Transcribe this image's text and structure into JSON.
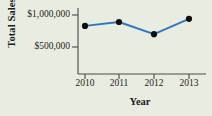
{
  "chart_data": {
    "type": "line",
    "title": "",
    "xlabel": "Year",
    "ylabel": "Total Sales",
    "categories": [
      "2010",
      "2011",
      "2012",
      "2013"
    ],
    "x": [
      2010,
      2011,
      2012,
      2013
    ],
    "values": [
      830000,
      890000,
      700000,
      940000
    ],
    "series": [
      {
        "name": "Total Sales",
        "values": [
          830000,
          890000,
          700000,
          940000
        ]
      }
    ],
    "ytick_labels": [
      "$1,000,000",
      "$500,000"
    ],
    "ytick_values": [
      1000000,
      500000
    ],
    "xtick_labels": [
      "2010",
      "2011",
      "2012",
      "2013"
    ],
    "ylim": [
      0,
      1150000
    ],
    "xlim": [
      2009.5,
      2013.5
    ],
    "grid": false,
    "legend": false,
    "legend_position": "none",
    "colors": {
      "line": "#2f76bf",
      "marker": "#101010",
      "axis": "#4a4a4a",
      "text": "#1c1c1c",
      "background": "#e9ece0"
    }
  },
  "axes": {
    "y_title": "Total Sales",
    "x_title": "Year"
  },
  "ticks": {
    "y": [
      {
        "label": "$1,000,000"
      },
      {
        "label": "$500,000"
      }
    ],
    "x": [
      {
        "label": "2010"
      },
      {
        "label": "2011"
      },
      {
        "label": "2012"
      },
      {
        "label": "2013"
      }
    ]
  }
}
